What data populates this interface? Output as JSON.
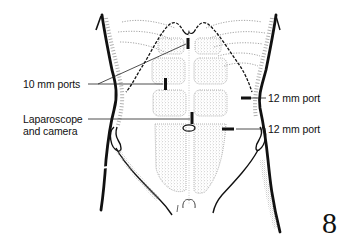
{
  "figure": {
    "number": "8"
  },
  "labels": {
    "ten_mm_ports": "10 mm ports",
    "laparoscope_line1": "Laparoscope",
    "laparoscope_line2": "and camera",
    "twelve_mm_port_upper": "12 mm port",
    "twelve_mm_port_lower": "12 mm port"
  },
  "ports": [
    {
      "name": "upper-midline-10mm",
      "size": "10 mm",
      "x": 188,
      "y": 45
    },
    {
      "name": "left-10mm",
      "size": "10 mm",
      "x": 165,
      "y": 84
    },
    {
      "name": "umbilical-laparoscope",
      "size": "camera",
      "x": 192,
      "y": 120
    },
    {
      "name": "right-upper-12mm",
      "size": "12 mm",
      "x": 246,
      "y": 98
    },
    {
      "name": "right-lower-12mm",
      "size": "12 mm",
      "x": 228,
      "y": 129
    }
  ],
  "colors": {
    "ink": "#111111",
    "stipple": "#9a9a9a",
    "background": "#ffffff"
  }
}
